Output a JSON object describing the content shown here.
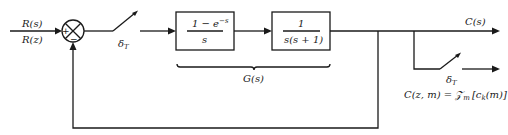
{
  "diagram": {
    "type": "sampled-data feedback control system",
    "input": {
      "label_top": "R(s)",
      "label_bottom": "R(z)"
    },
    "summing_junction": {
      "plus": "+",
      "minus": "−"
    },
    "sampler_1": {
      "label": "δ",
      "subscript": "T"
    },
    "block_zoh": {
      "numerator": "1 − e",
      "exponent": "−s",
      "denominator": "s"
    },
    "block_plant": {
      "numerator": "1",
      "denominator": "s(s + 1)"
    },
    "brace_label": "G(s)",
    "output": {
      "label": "C(s)"
    },
    "sampler_2": {
      "label": "δ",
      "subscript": "T"
    },
    "modified_z_output": {
      "lhs": "C(z, m) = ",
      "operator": "𝒵",
      "operator_subscript": "m",
      "rhs": "[c",
      "rhs_sub": "k",
      "rhs_end": "(m)]"
    }
  }
}
